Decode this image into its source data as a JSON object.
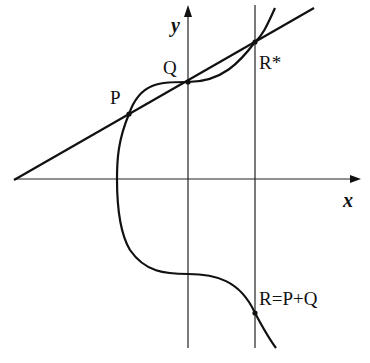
{
  "diagram": {
    "axes": {
      "x_label": "x",
      "y_label": "y"
    },
    "points": {
      "P": "P",
      "Q": "Q",
      "R_star": "R*",
      "R": "R=P+Q"
    },
    "colors": {
      "stroke": "#111111",
      "background": "#ffffff"
    }
  }
}
